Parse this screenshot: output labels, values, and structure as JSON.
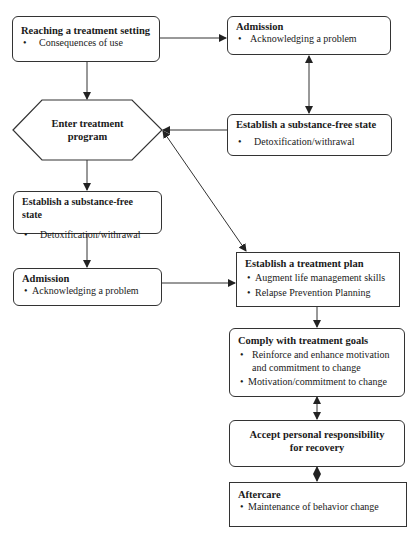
{
  "nodes": {
    "reaching": {
      "title": "Reaching a treatment setting",
      "bullets": [
        "Consequences of use"
      ]
    },
    "admission_right": {
      "title": "Admission",
      "bullets": [
        "Acknowledging a problem"
      ]
    },
    "enter_program": {
      "line1": "Enter treatment",
      "line2": "program"
    },
    "substance_free_right": {
      "title": "Establish a substance-free state",
      "bullets": [
        "Detoxification/withrawal"
      ]
    },
    "substance_free_left": {
      "title": "Establish a substance-free state",
      "bullets": [
        "Detoxification/withrawal"
      ]
    },
    "admission_left": {
      "title": "Admission",
      "bullets": [
        "Acknowledging a problem"
      ]
    },
    "treatment_plan": {
      "title": "Establish a treatment plan",
      "bullets": [
        "Augment life management skills",
        "Relapse Prevention Planning"
      ]
    },
    "comply_goals": {
      "title": "Comply with treatment goals",
      "bullets": [
        "Reinforce and enhance motivation and commitment to change",
        "Motivation/commitment to change"
      ]
    },
    "accept_responsibility": {
      "line1": "Accept personal responsibility",
      "line2": "for recovery"
    },
    "aftercare": {
      "title": "Aftercare",
      "bullets": [
        "Maintenance of behavior change"
      ]
    }
  },
  "edges": [
    {
      "from": "reaching",
      "to": "admission_right",
      "type": "arrow"
    },
    {
      "from": "reaching",
      "to": "enter_program",
      "type": "arrow"
    },
    {
      "from": "admission_right",
      "to": "substance_free_right",
      "type": "bidirectional"
    },
    {
      "from": "substance_free_right",
      "to": "enter_program",
      "type": "arrow"
    },
    {
      "from": "enter_program",
      "to": "treatment_plan",
      "type": "bidirectional"
    },
    {
      "from": "enter_program",
      "to": "substance_free_left",
      "type": "arrow"
    },
    {
      "from": "substance_free_left",
      "to": "admission_left",
      "type": "arrow"
    },
    {
      "from": "admission_left",
      "to": "treatment_plan",
      "type": "arrow"
    },
    {
      "from": "treatment_plan",
      "to": "comply_goals",
      "type": "arrow"
    },
    {
      "from": "comply_goals",
      "to": "accept_responsibility",
      "type": "bidirectional"
    },
    {
      "from": "accept_responsibility",
      "to": "aftercare",
      "type": "bidirectional"
    }
  ],
  "colors": {
    "line": "#333333",
    "background": "#ffffff",
    "text": "#1a1a1a"
  }
}
